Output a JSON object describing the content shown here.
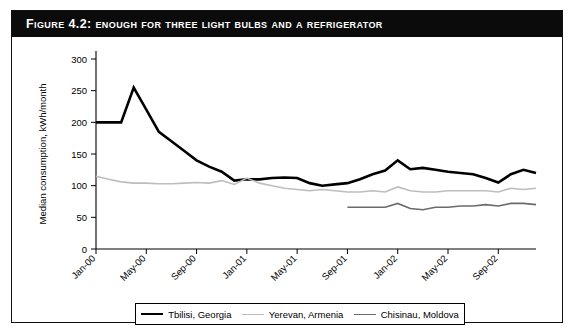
{
  "figure": {
    "label": "Figure 4.2:",
    "title": "Figure 4.2:  Enough for Three Light Bulbs and a Refrigerator",
    "border_color": "#111111",
    "title_bar_color": "#0b0b0b",
    "title_text_color": "#ffffff"
  },
  "legend": {
    "position": "bottom",
    "items": [
      {
        "label": "Tbilisi, Georgia",
        "color": "#000000",
        "width": 2.6
      },
      {
        "label": "Yerevan, Armenia",
        "color": "#bdbdbd",
        "width": 1.6
      },
      {
        "label": "Chisinau, Moldova",
        "color": "#6b6b6b",
        "width": 1.6
      }
    ]
  },
  "chart_data": {
    "type": "line",
    "title": "Figure 4.2:  Enough for Three Light Bulbs and a Refrigerator",
    "xlabel": "",
    "ylabel": "Median consumption, kWh/month",
    "ylim": [
      0,
      300
    ],
    "ytick_step": 50,
    "yticks": [
      0,
      50,
      100,
      150,
      200,
      250,
      300
    ],
    "grid": false,
    "x": [
      "Jan-00",
      "Feb-00",
      "Mar-00",
      "Apr-00",
      "May-00",
      "Jun-00",
      "Jul-00",
      "Aug-00",
      "Sep-00",
      "Oct-00",
      "Nov-00",
      "Dec-00",
      "Jan-01",
      "Feb-01",
      "Mar-01",
      "Apr-01",
      "May-01",
      "Jun-01",
      "Jul-01",
      "Aug-01",
      "Sep-01",
      "Oct-01",
      "Nov-01",
      "Dec-01",
      "Jan-02",
      "Feb-02",
      "Mar-02",
      "Apr-02",
      "May-02",
      "Jun-02",
      "Jul-02",
      "Aug-02",
      "Sep-02",
      "Oct-02",
      "Nov-02",
      "Dec-02"
    ],
    "xtick_labels": [
      "Jan-00",
      "May-00",
      "Sep-00",
      "Jan-01",
      "May-01",
      "Sep-01",
      "Jan-02",
      "May-02",
      "Sep-02"
    ],
    "xtick_indices": [
      0,
      4,
      8,
      12,
      16,
      20,
      24,
      28,
      32
    ],
    "series": [
      {
        "name": "Tbilisi, Georgia",
        "color": "#000000",
        "width": 2.6,
        "values": [
          200,
          200,
          200,
          255,
          220,
          185,
          170,
          155,
          140,
          130,
          122,
          108,
          110,
          110,
          112,
          113,
          112,
          104,
          100,
          102,
          104,
          110,
          118,
          124,
          140,
          126,
          128,
          125,
          122,
          120,
          118,
          112,
          105,
          118,
          125,
          120
        ]
      },
      {
        "name": "Yerevan, Armenia",
        "color": "#bdbdbd",
        "width": 1.6,
        "values": [
          115,
          110,
          106,
          104,
          104,
          103,
          103,
          104,
          105,
          104,
          108,
          102,
          112,
          104,
          100,
          96,
          94,
          92,
          94,
          92,
          90,
          90,
          92,
          90,
          98,
          92,
          90,
          90,
          92,
          92,
          92,
          92,
          90,
          96,
          94,
          96
        ]
      },
      {
        "name": "Chisinau, Moldova",
        "color": "#6b6b6b",
        "width": 1.6,
        "values": [
          null,
          null,
          null,
          null,
          null,
          null,
          null,
          null,
          null,
          null,
          null,
          null,
          null,
          null,
          null,
          null,
          null,
          null,
          null,
          null,
          66,
          66,
          66,
          66,
          72,
          64,
          62,
          66,
          66,
          68,
          68,
          70,
          68,
          72,
          72,
          70
        ]
      }
    ]
  }
}
